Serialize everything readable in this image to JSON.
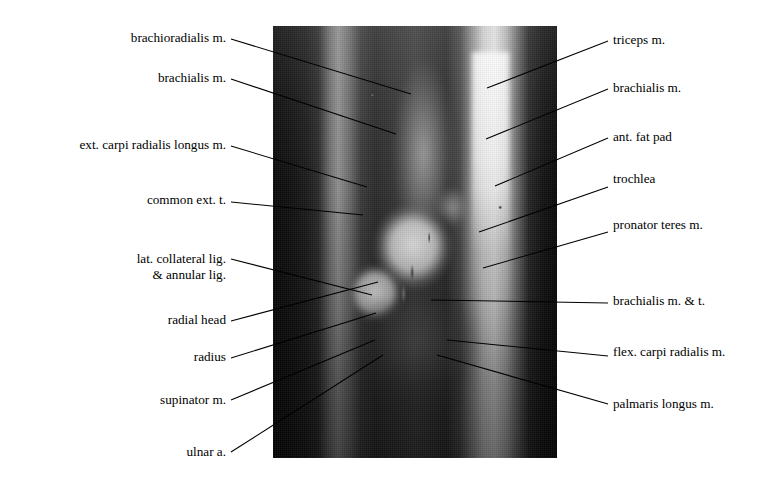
{
  "figure": {
    "kind": "annotated-mri",
    "modality": "MRI",
    "view": "sagittal elbow",
    "background_color": "#ffffff",
    "line_color": "#000000",
    "text_color": "#000000",
    "image_plate": {
      "x": 273,
      "y": 26,
      "width": 284,
      "height": 432
    }
  },
  "labels_left": [
    {
      "text": "brachioradialis m.",
      "text_x": 226,
      "text_y": 41,
      "leader": {
        "x1": 231,
        "y1": 39,
        "x2": 411,
        "y2": 94
      }
    },
    {
      "text": "brachialis m.",
      "text_x": 226,
      "text_y": 81,
      "leader": {
        "x1": 231,
        "y1": 79,
        "x2": 396,
        "y2": 134
      }
    },
    {
      "text": "ext. carpi radialis longus m.",
      "text_x": 226,
      "text_y": 148,
      "leader": {
        "x1": 231,
        "y1": 146,
        "x2": 367,
        "y2": 187
      }
    },
    {
      "text": "common ext. t.",
      "text_x": 226,
      "text_y": 203,
      "leader": {
        "x1": 231,
        "y1": 202,
        "x2": 363,
        "y2": 215
      }
    },
    {
      "text": "lat. collateral lig.",
      "text_x": 226,
      "text_y": 262,
      "text_line2": "& annular lig.",
      "leader": {
        "x1": 231,
        "y1": 259,
        "x2": 372,
        "y2": 295
      }
    },
    {
      "text": "radial head",
      "text_x": 226,
      "text_y": 323,
      "leader": {
        "x1": 231,
        "y1": 321,
        "x2": 378,
        "y2": 282
      }
    },
    {
      "text": "radius",
      "text_x": 226,
      "text_y": 360,
      "leader": {
        "x1": 231,
        "y1": 358,
        "x2": 376,
        "y2": 313
      }
    },
    {
      "text": "supinator m.",
      "text_x": 226,
      "text_y": 403,
      "leader": {
        "x1": 231,
        "y1": 400,
        "x2": 375,
        "y2": 340
      }
    },
    {
      "text": "ulnar a.",
      "text_x": 226,
      "text_y": 455,
      "leader": {
        "x1": 231,
        "y1": 452,
        "x2": 383,
        "y2": 355
      }
    }
  ],
  "labels_right": [
    {
      "text": "triceps m.",
      "text_x": 613,
      "text_y": 43,
      "leader": {
        "x1": 608,
        "y1": 41,
        "x2": 487,
        "y2": 88
      }
    },
    {
      "text": "brachialis m.",
      "text_x": 613,
      "text_y": 91,
      "leader": {
        "x1": 608,
        "y1": 89,
        "x2": 486,
        "y2": 139
      }
    },
    {
      "text": "ant. fat pad",
      "text_x": 613,
      "text_y": 140,
      "leader": {
        "x1": 608,
        "y1": 138,
        "x2": 495,
        "y2": 186
      }
    },
    {
      "text": "trochlea",
      "text_x": 613,
      "text_y": 182,
      "leader": {
        "x1": 608,
        "y1": 187,
        "x2": 479,
        "y2": 232
      }
    },
    {
      "text": "pronator teres m.",
      "text_x": 613,
      "text_y": 228,
      "leader": {
        "x1": 608,
        "y1": 232,
        "x2": 483,
        "y2": 268
      }
    },
    {
      "text": "brachialis m. & t.",
      "text_x": 613,
      "text_y": 304,
      "leader": {
        "x1": 608,
        "y1": 303,
        "x2": 431,
        "y2": 300
      }
    },
    {
      "text": "flex. carpi radialis m.",
      "text_x": 613,
      "text_y": 355,
      "leader": {
        "x1": 608,
        "y1": 356,
        "x2": 447,
        "y2": 340
      }
    },
    {
      "text": "palmaris longus m.",
      "text_x": 613,
      "text_y": 407,
      "leader": {
        "x1": 608,
        "y1": 404,
        "x2": 437,
        "y2": 355
      }
    }
  ]
}
